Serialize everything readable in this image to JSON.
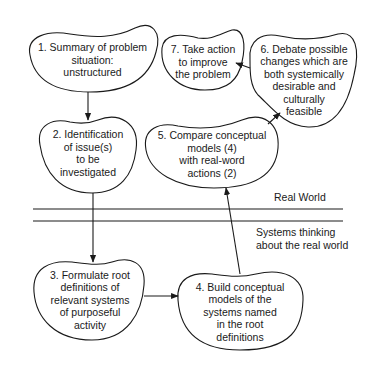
{
  "diagram": {
    "nodes": [
      {
        "id": 1,
        "lines": [
          "1. Summary of problem",
          "situation:",
          "unstructured"
        ]
      },
      {
        "id": 2,
        "lines": [
          "2. Identification",
          "of issue(s)",
          "to be",
          "investigated"
        ]
      },
      {
        "id": 3,
        "lines": [
          "3. Formulate root",
          "definitions of",
          "relevant systems",
          "of purposeful",
          "activity"
        ]
      },
      {
        "id": 4,
        "lines": [
          "4. Build conceptual",
          "models of the",
          "systems named",
          "in the root",
          "definitions"
        ]
      },
      {
        "id": 5,
        "lines": [
          "5. Compare conceptual",
          "models (4)",
          "with real-word",
          "actions (2)"
        ]
      },
      {
        "id": 6,
        "lines": [
          "6. Debate possible",
          "changes which are",
          "both systemically",
          "desirable and",
          "culturally",
          "feasible"
        ]
      },
      {
        "id": 7,
        "lines": [
          "7. Take action",
          "to improve",
          "the problem"
        ]
      }
    ],
    "edges": [
      {
        "from": 1,
        "to": 2
      },
      {
        "from": 2,
        "to": 3
      },
      {
        "from": 3,
        "to": 4
      },
      {
        "from": 4,
        "to": 5
      },
      {
        "from": 5,
        "to": 6
      },
      {
        "from": 6,
        "to": 7
      }
    ],
    "regions": {
      "upper": "Real World",
      "lower_line1": "Systems thinking",
      "lower_line2": "about the real world"
    },
    "colors": {
      "stroke": "#1a1a1a",
      "background": "#ffffff"
    }
  }
}
